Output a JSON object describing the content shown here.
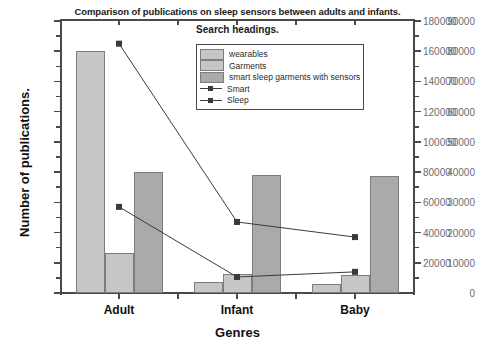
{
  "chart_data": {
    "type": "bar",
    "title": "Comparison of publications on sleep sensors between adults and infants.",
    "subtitle": "Search headings.",
    "xlabel": "Genres",
    "ylabel": "Number of publications.",
    "categories": [
      "Adult",
      "Infant",
      "Baby"
    ],
    "ylim": [
      0,
      90000
    ],
    "ylim_right": [
      0,
      180000
    ],
    "yticks": [
      0,
      10000,
      20000,
      30000,
      40000,
      50000,
      60000,
      70000,
      80000,
      90000
    ],
    "yticks_right": [
      20000,
      40000,
      60000,
      80000,
      100000,
      120000,
      140000,
      160000,
      180000
    ],
    "ytick_labels": [
      "0",
      "10000",
      "20000",
      "30000",
      "40000",
      "50000",
      "60000",
      "70000",
      "80000",
      "90000"
    ],
    "ytick_labels_right": [
      "20000",
      "40000",
      "60000",
      "80000",
      "100000",
      "120000",
      "140000",
      "160000",
      "180000"
    ],
    "grid": false,
    "legend_position": "upper center",
    "series": [
      {
        "name": "wearables",
        "kind": "bar",
        "axis": "left",
        "color": "#c6c6c6",
        "values": [
          80200,
          3700,
          3000
        ]
      },
      {
        "name": "Garments",
        "kind": "bar",
        "axis": "left",
        "color": "#c6c6c6",
        "values": [
          13200,
          6200,
          6000
        ]
      },
      {
        "name": "smart sleep garments with sensors",
        "kind": "bar",
        "axis": "left",
        "color": "#aaaaaa",
        "values": [
          40000,
          39000,
          38800
        ]
      },
      {
        "name": "Smart",
        "kind": "line",
        "axis": "right",
        "color": "#3a3a3a",
        "values": [
          165000,
          47000,
          37000
        ]
      },
      {
        "name": "Sleep",
        "kind": "line",
        "axis": "right",
        "color": "#3a3a3a",
        "values": [
          57000,
          10600,
          14000
        ]
      }
    ]
  },
  "axes": {
    "left_title": "Number of publications.",
    "bottom_title": "Genres"
  },
  "legend": {
    "entries": [
      {
        "label": "wearables",
        "marker": "square-swatch"
      },
      {
        "label": "Garments",
        "marker": "square-swatch"
      },
      {
        "label": "smart sleep garments with sensors",
        "marker": "square-swatch"
      },
      {
        "label": "Smart",
        "marker": "line-square-marker"
      },
      {
        "label": "Sleep",
        "marker": "line-square-marker"
      }
    ]
  }
}
